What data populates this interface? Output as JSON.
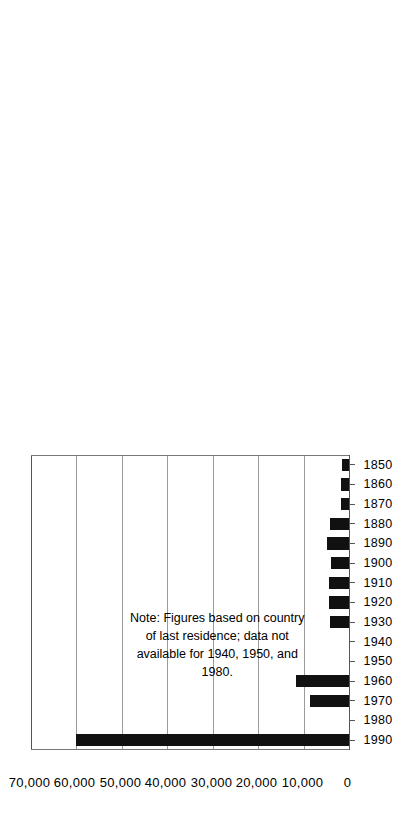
{
  "chart_data": {
    "type": "bar",
    "orientation": "horizontal-rotated",
    "title": "",
    "subtitle": "",
    "xlabel": "",
    "ylabel": "",
    "note": "Note: Figures based on country\nof last residence; data not\navailable for 1940, 1950, and\n1980.",
    "categories": [
      "1850",
      "1860",
      "1870",
      "1880",
      "1890",
      "1900",
      "1910",
      "1920",
      "1930",
      "1940",
      "1950",
      "1960",
      "1970",
      "1980",
      "1990"
    ],
    "values": [
      1600,
      1800,
      1800,
      4200,
      4900,
      4000,
      4400,
      4400,
      4200,
      null,
      null,
      11700,
      8500,
      null,
      60000
    ],
    "value_ticks": [
      "0",
      "10,000",
      "20,000",
      "30,000",
      "40,000",
      "50,000",
      "60,000",
      "70,000"
    ],
    "value_tick_numbers": [
      0,
      10000,
      20000,
      30000,
      40000,
      50000,
      60000,
      70000
    ],
    "ylim": [
      0,
      70000
    ],
    "grid": true,
    "legend": null,
    "legend_position": "none",
    "bar_color": "#111111",
    "grid_color": "#9a9a9a",
    "axis_color": "#555555",
    "missing_data_years": [
      "1940",
      "1950",
      "1980"
    ]
  },
  "axis": {
    "value_axis_name": "immigration-count-axis",
    "category_axis_name": "decade-axis"
  }
}
